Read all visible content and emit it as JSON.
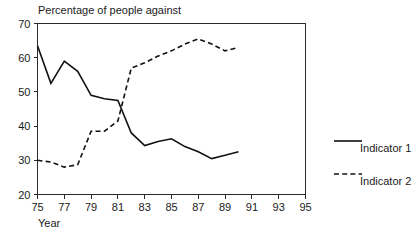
{
  "chart_data": {
    "type": "line",
    "title": "Percentage of people against",
    "xlabel": "Year",
    "ylabel": "",
    "xlim": [
      75,
      95
    ],
    "ylim": [
      20,
      70
    ],
    "xticks": [
      75,
      77,
      79,
      81,
      83,
      85,
      87,
      89,
      91,
      93,
      95
    ],
    "yticks": [
      20,
      30,
      40,
      50,
      60,
      70
    ],
    "xtick_labels": [
      "75",
      "77",
      "79",
      "81",
      "83",
      "85",
      "87",
      "89",
      "91",
      "93",
      "95"
    ],
    "ytick_labels": [
      "20",
      "30",
      "40",
      "50",
      "60",
      "70"
    ],
    "grid": false,
    "legend_position": "right",
    "x": [
      75,
      76,
      77,
      78,
      79,
      80,
      81,
      82,
      83,
      84,
      85,
      86,
      87,
      88,
      89,
      90
    ],
    "series": [
      {
        "name": "Indicator 1",
        "style": "solid",
        "color": "#111111",
        "values": [
          63.5,
          52.5,
          59,
          56,
          49,
          48,
          47.5,
          38,
          34.3,
          35.5,
          36.3,
          34,
          32.5,
          30.5,
          31.5,
          32.5
        ]
      },
      {
        "name": "Indicator 2",
        "style": "dashed",
        "color": "#111111",
        "values": [
          30,
          29.5,
          28,
          28.7,
          38.5,
          38.5,
          41.5,
          57,
          58.5,
          60.5,
          62,
          64,
          65.5,
          64,
          62,
          63
        ]
      }
    ]
  },
  "legend": {
    "items": [
      {
        "label": "Indicator 1",
        "style": "solid"
      },
      {
        "label": "Indicator 2",
        "style": "dashed"
      }
    ]
  }
}
